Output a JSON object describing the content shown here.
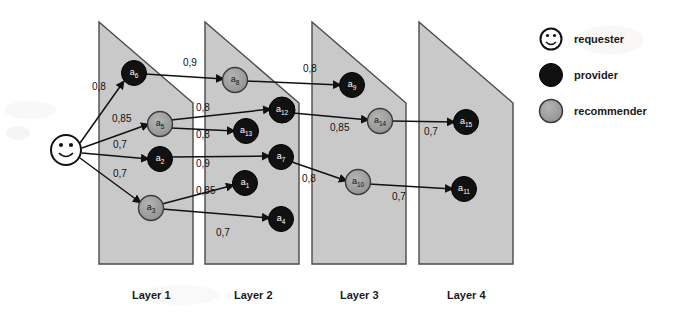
{
  "diagram": {
    "colors": {
      "panel_fill": "#c9c9c9",
      "panel_stroke": "#4a4a4a",
      "provider": "#111111",
      "recommender": "#9a9a9a",
      "recommender_stroke": "#3a3a3a",
      "requester_fill": "#ffffff",
      "requester_stroke": "#111111",
      "edge": "#111111",
      "text": "#1a1a1a",
      "background": "#ffffff"
    },
    "layers": [
      {
        "id": "layer1",
        "label": "Layer 1"
      },
      {
        "id": "layer2",
        "label": "Layer 2"
      },
      {
        "id": "layer3",
        "label": "Layer 3"
      },
      {
        "id": "layer4",
        "label": "Layer 4"
      }
    ],
    "requester": {
      "id": "requester",
      "label": "requester",
      "x": 66,
      "y": 150
    },
    "nodes": [
      {
        "id": "a6",
        "base": "a",
        "sub": "6",
        "role": "provider",
        "layer": 1,
        "x": 134,
        "y": 73
      },
      {
        "id": "a5",
        "base": "a",
        "sub": "5",
        "role": "recommender",
        "layer": 1,
        "x": 160,
        "y": 124
      },
      {
        "id": "a2",
        "base": "a",
        "sub": "2",
        "role": "provider",
        "layer": 1,
        "x": 160,
        "y": 159
      },
      {
        "id": "a3",
        "base": "a",
        "sub": "3",
        "role": "recommender",
        "layer": 1,
        "x": 151,
        "y": 208
      },
      {
        "id": "a8",
        "base": "a",
        "sub": "8",
        "role": "recommender",
        "layer": 2,
        "x": 235,
        "y": 80
      },
      {
        "id": "a12",
        "base": "a",
        "sub": "12",
        "role": "provider",
        "layer": 2,
        "x": 282,
        "y": 110
      },
      {
        "id": "a13",
        "base": "a",
        "sub": "13",
        "role": "provider",
        "layer": 2,
        "x": 246,
        "y": 131
      },
      {
        "id": "a7",
        "base": "a",
        "sub": "7",
        "role": "provider",
        "layer": 2,
        "x": 281,
        "y": 157
      },
      {
        "id": "a1",
        "base": "a",
        "sub": "1",
        "role": "provider",
        "layer": 2,
        "x": 245,
        "y": 183
      },
      {
        "id": "a4",
        "base": "a",
        "sub": "4",
        "role": "provider",
        "layer": 2,
        "x": 281,
        "y": 219
      },
      {
        "id": "a9",
        "base": "a",
        "sub": "9",
        "role": "provider",
        "layer": 3,
        "x": 352,
        "y": 85
      },
      {
        "id": "a14",
        "base": "a",
        "sub": "14",
        "role": "recommender",
        "layer": 3,
        "x": 380,
        "y": 121
      },
      {
        "id": "a10",
        "base": "a",
        "sub": "10",
        "role": "recommender",
        "layer": 3,
        "x": 358,
        "y": 182
      },
      {
        "id": "a15",
        "base": "a",
        "sub": "15",
        "role": "provider",
        "layer": 4,
        "x": 466,
        "y": 122
      },
      {
        "id": "a11",
        "base": "a",
        "sub": "11",
        "role": "provider",
        "layer": 4,
        "x": 464,
        "y": 189
      }
    ],
    "edges": [
      {
        "from": "requester",
        "to": "a6",
        "weight": "0,8",
        "lx": 92,
        "ly": 90
      },
      {
        "from": "requester",
        "to": "a5",
        "weight": "0,85",
        "lx": 112,
        "ly": 122
      },
      {
        "from": "requester",
        "to": "a2",
        "weight": "0,7",
        "lx": 113,
        "ly": 148
      },
      {
        "from": "requester",
        "to": "a3",
        "weight": "0,7",
        "lx": 113,
        "ly": 177
      },
      {
        "from": "a6",
        "to": "a8",
        "weight": "0,9",
        "lx": 183,
        "ly": 66
      },
      {
        "from": "a5",
        "to": "a12",
        "weight": "0,8",
        "lx": 196,
        "ly": 111
      },
      {
        "from": "a5",
        "to": "a13",
        "weight": "0,8",
        "lx": 196,
        "ly": 138
      },
      {
        "from": "a2",
        "to": "a7",
        "weight": "0,9",
        "lx": 196,
        "ly": 167
      },
      {
        "from": "a3",
        "to": "a1",
        "weight": "0,85",
        "lx": 196,
        "ly": 194
      },
      {
        "from": "a3",
        "to": "a4",
        "weight": "0,7",
        "lx": 216,
        "ly": 236
      },
      {
        "from": "a8",
        "to": "a9",
        "weight": "0,8",
        "lx": 303,
        "ly": 72
      },
      {
        "from": "a12",
        "to": "a14",
        "weight": "0,85",
        "lx": 330,
        "ly": 131
      },
      {
        "from": "a7",
        "to": "a10",
        "weight": "0,8",
        "lx": 302,
        "ly": 182
      },
      {
        "from": "a14",
        "to": "a15",
        "weight": "0,7",
        "lx": 424,
        "ly": 135
      },
      {
        "from": "a10",
        "to": "a11",
        "weight": "0,7",
        "lx": 392,
        "ly": 200
      }
    ],
    "legend": {
      "items": [
        {
          "id": "legend-requester",
          "label": "requester",
          "role": "requester"
        },
        {
          "id": "legend-provider",
          "label": "provider",
          "role": "provider"
        },
        {
          "id": "legend-recommender",
          "label": "recommender",
          "role": "recommender"
        }
      ]
    }
  }
}
